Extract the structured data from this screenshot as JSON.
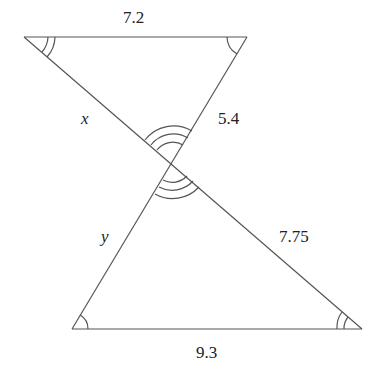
{
  "diagram": {
    "stroke_color": "#555555",
    "labels": {
      "top_side": "7.2",
      "bottom_side": "9.3",
      "upper_left_segment": "x",
      "upper_right_segment": "5.4",
      "lower_left_segment": "y",
      "lower_right_segment": "7.75"
    },
    "angle_marks": {
      "top_left": "double arc",
      "top_right": "single arc",
      "bottom_left": "single arc",
      "bottom_right": "double arc",
      "center_top": "triple arc",
      "center_bottom": "triple arc"
    }
  }
}
